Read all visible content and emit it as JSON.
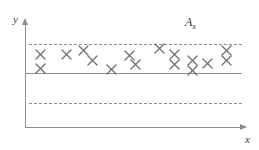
{
  "figure": {
    "title": "",
    "axis": {
      "y_label": "y",
      "x_label": "x"
    },
    "region_label": {
      "base": "A",
      "subscript": "x"
    },
    "colors": {
      "line": "#8c8c8c",
      "marker": "#6e6e6e",
      "text": "#3a3a3a",
      "background": "#ffffff"
    }
  },
  "chart_data": {
    "type": "scatter",
    "title": "",
    "xlabel": "x",
    "ylabel": "y",
    "grid": false,
    "legend": null,
    "xlim": [
      0,
      100
    ],
    "ylim": [
      0,
      100
    ],
    "annotations": [
      {
        "text": "A_x",
        "x": 79,
        "y": 93,
        "role": "region-label"
      }
    ],
    "reference_lines": [
      {
        "name": "upper-control-limit",
        "y": 80,
        "style": "dashed",
        "x_start": 2,
        "x_end": 100
      },
      {
        "name": "center-line",
        "y": 65,
        "style": "solid",
        "x_start": 0,
        "x_end": 100
      },
      {
        "name": "lower-control-limit",
        "y": 49,
        "style": "dashed",
        "x_start": 2,
        "x_end": 100
      }
    ],
    "series": [
      {
        "name": "observations",
        "marker": "x",
        "points": [
          {
            "x": 7,
            "y": 70
          },
          {
            "x": 7,
            "y": 57
          },
          {
            "x": 19,
            "y": 70
          },
          {
            "x": 27,
            "y": 74
          },
          {
            "x": 31,
            "y": 65
          },
          {
            "x": 40,
            "y": 56
          },
          {
            "x": 48,
            "y": 69
          },
          {
            "x": 51,
            "y": 61
          },
          {
            "x": 62,
            "y": 76
          },
          {
            "x": 69,
            "y": 70
          },
          {
            "x": 69,
            "y": 61
          },
          {
            "x": 77,
            "y": 65
          },
          {
            "x": 77,
            "y": 55
          },
          {
            "x": 84,
            "y": 62
          },
          {
            "x": 93,
            "y": 74
          },
          {
            "x": 93,
            "y": 65
          }
        ]
      }
    ]
  }
}
